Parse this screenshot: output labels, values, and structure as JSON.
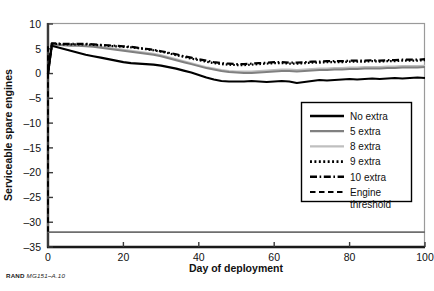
{
  "figure": {
    "source_note_prefix": "RAND",
    "source_note_id": "MG151–A.10",
    "background_color": "#ffffff"
  },
  "chart_data": {
    "type": "line",
    "title": "",
    "xlabel": "Day of deployment",
    "ylabel": "Serviceable spare engines",
    "xlim": [
      0,
      100
    ],
    "ylim": [
      -35,
      10
    ],
    "xticks": [
      0,
      20,
      40,
      60,
      80,
      100
    ],
    "yticks": [
      10,
      5,
      0,
      -5,
      -10,
      -15,
      -20,
      -25,
      -30,
      -35
    ],
    "grid": false,
    "legend_position": "center-right",
    "colors": {
      "no_extra": "#000000",
      "five_extra": "#808080",
      "eight_extra": "#bfbfbf",
      "nine_extra": "#000000",
      "ten_extra": "#000000",
      "engine_threshold": "#000000",
      "axis": "#6e6e6e",
      "frame": "#9a9a9a"
    },
    "series": [
      {
        "name": "No extra",
        "style": "solid",
        "color": "#000000",
        "width": 2.2,
        "x": [
          0,
          1,
          2,
          4,
          6,
          8,
          10,
          12,
          14,
          16,
          18,
          20,
          22,
          24,
          26,
          28,
          30,
          32,
          34,
          36,
          38,
          40,
          42,
          44,
          46,
          48,
          50,
          52,
          54,
          56,
          58,
          60,
          62,
          64,
          66,
          68,
          70,
          72,
          74,
          76,
          78,
          80,
          82,
          84,
          86,
          88,
          90,
          92,
          94,
          96,
          98,
          100
        ],
        "values": [
          0,
          5.6,
          5.4,
          5.0,
          4.6,
          4.2,
          3.8,
          3.5,
          3.2,
          2.9,
          2.6,
          2.3,
          2.1,
          2.0,
          1.9,
          1.8,
          1.6,
          1.3,
          1.0,
          0.6,
          0.2,
          -0.3,
          -0.8,
          -1.2,
          -1.5,
          -1.6,
          -1.6,
          -1.6,
          -1.5,
          -1.6,
          -1.7,
          -1.6,
          -1.5,
          -1.6,
          -1.9,
          -1.7,
          -1.5,
          -1.3,
          -1.4,
          -1.3,
          -1.2,
          -1.1,
          -1.2,
          -1.1,
          -1.0,
          -1.1,
          -1.0,
          -0.9,
          -1.0,
          -0.9,
          -0.8,
          -0.9
        ]
      },
      {
        "name": "5 extra",
        "style": "solid",
        "color": "#808080",
        "width": 2.0,
        "x": [
          0,
          1,
          2,
          4,
          6,
          8,
          10,
          12,
          14,
          16,
          18,
          20,
          22,
          24,
          26,
          28,
          30,
          32,
          34,
          36,
          38,
          40,
          42,
          44,
          46,
          48,
          50,
          52,
          54,
          56,
          58,
          60,
          62,
          64,
          66,
          68,
          70,
          72,
          74,
          76,
          78,
          80,
          82,
          84,
          86,
          88,
          90,
          92,
          94,
          96,
          98,
          100
        ],
        "values": [
          0,
          5.9,
          5.8,
          5.7,
          5.6,
          5.6,
          5.5,
          5.4,
          5.2,
          5.0,
          4.8,
          4.6,
          4.4,
          4.2,
          4.0,
          3.8,
          3.5,
          3.1,
          2.7,
          2.3,
          1.9,
          1.5,
          1.1,
          0.8,
          0.5,
          0.3,
          0.2,
          0.1,
          0.1,
          0.2,
          0.3,
          0.4,
          0.5,
          0.5,
          0.4,
          0.5,
          0.6,
          0.7,
          0.7,
          0.8,
          0.8,
          0.9,
          0.9,
          1.0,
          1.0,
          1.0,
          1.1,
          1.1,
          1.2,
          1.2,
          1.2,
          1.3
        ]
      },
      {
        "name": "8 extra",
        "style": "solid",
        "color": "#bfbfbf",
        "width": 2.0,
        "x": [
          0,
          1,
          2,
          4,
          6,
          8,
          10,
          12,
          14,
          16,
          18,
          20,
          22,
          24,
          26,
          28,
          30,
          32,
          34,
          36,
          38,
          40,
          42,
          44,
          46,
          48,
          50,
          52,
          54,
          56,
          58,
          60,
          62,
          64,
          66,
          68,
          70,
          72,
          74,
          76,
          78,
          80,
          82,
          84,
          86,
          88,
          90,
          92,
          94,
          96,
          98,
          100
        ],
        "values": [
          0,
          6.0,
          5.9,
          5.8,
          5.8,
          5.7,
          5.7,
          5.6,
          5.4,
          5.2,
          5.0,
          4.8,
          4.6,
          4.4,
          4.2,
          4.0,
          3.7,
          3.3,
          2.9,
          2.5,
          2.1,
          1.7,
          1.3,
          1.0,
          0.7,
          0.5,
          0.4,
          0.4,
          0.4,
          0.5,
          0.6,
          0.7,
          0.8,
          0.8,
          0.7,
          0.8,
          0.9,
          1.0,
          1.0,
          1.1,
          1.1,
          1.2,
          1.2,
          1.3,
          1.3,
          1.3,
          1.4,
          1.4,
          1.5,
          1.5,
          1.5,
          1.6
        ]
      },
      {
        "name": "9 extra",
        "style": "dotted",
        "color": "#000000",
        "width": 2.2,
        "x": [
          0,
          1,
          2,
          4,
          6,
          8,
          10,
          12,
          14,
          16,
          18,
          20,
          22,
          24,
          26,
          28,
          30,
          32,
          34,
          36,
          38,
          40,
          42,
          44,
          46,
          48,
          50,
          52,
          54,
          56,
          58,
          60,
          62,
          64,
          66,
          68,
          70,
          72,
          74,
          76,
          78,
          80,
          82,
          84,
          86,
          88,
          90,
          92,
          94,
          96,
          98,
          100
        ],
        "values": [
          0,
          6.0,
          6.0,
          5.9,
          5.9,
          5.9,
          5.9,
          5.8,
          5.7,
          5.6,
          5.5,
          5.4,
          5.3,
          5.1,
          4.9,
          4.7,
          4.4,
          4.1,
          3.7,
          3.4,
          3.0,
          2.7,
          2.4,
          2.1,
          1.9,
          1.8,
          1.7,
          1.7,
          1.8,
          1.9,
          2.0,
          2.1,
          2.1,
          2.0,
          2.0,
          2.1,
          2.2,
          2.2,
          2.3,
          2.3,
          2.3,
          2.4,
          2.4,
          2.4,
          2.5,
          2.4,
          2.5,
          2.5,
          2.6,
          2.6,
          2.6,
          2.7
        ]
      },
      {
        "name": "10 extra",
        "style": "dashdot",
        "color": "#000000",
        "width": 2.2,
        "x": [
          0,
          1,
          2,
          4,
          6,
          8,
          10,
          12,
          14,
          16,
          18,
          20,
          22,
          24,
          26,
          28,
          30,
          32,
          34,
          36,
          38,
          40,
          42,
          44,
          46,
          48,
          50,
          52,
          54,
          56,
          58,
          60,
          62,
          64,
          66,
          68,
          70,
          72,
          74,
          76,
          78,
          80,
          82,
          84,
          86,
          88,
          90,
          92,
          94,
          96,
          98,
          100
        ],
        "values": [
          0,
          6.1,
          6.1,
          6.0,
          6.0,
          6.0,
          6.0,
          5.9,
          5.8,
          5.7,
          5.6,
          5.5,
          5.4,
          5.2,
          5.0,
          4.8,
          4.5,
          4.2,
          3.9,
          3.5,
          3.2,
          2.9,
          2.6,
          2.3,
          2.1,
          2.0,
          1.9,
          1.9,
          2.0,
          2.1,
          2.2,
          2.3,
          2.3,
          2.2,
          2.2,
          2.3,
          2.4,
          2.4,
          2.5,
          2.5,
          2.5,
          2.6,
          2.6,
          2.6,
          2.7,
          2.6,
          2.7,
          2.7,
          2.8,
          2.8,
          2.8,
          2.9
        ]
      },
      {
        "name": "Engine threshold",
        "style": "dashed",
        "color": "#000000",
        "width": 2.0,
        "x": [
          0,
          0
        ],
        "values": [
          5.5,
          -32
        ]
      }
    ],
    "floor_line": {
      "name": "floor",
      "color": "#6e6e6e",
      "x": [
        0,
        100
      ],
      "values": [
        -32,
        -32
      ]
    }
  },
  "legend": {
    "items": [
      {
        "label": "No extra",
        "style": "solid",
        "color": "#000000",
        "width": 2.6
      },
      {
        "label": "5 extra",
        "style": "solid",
        "color": "#808080",
        "width": 2.2
      },
      {
        "label": "8 extra",
        "style": "solid",
        "color": "#bfbfbf",
        "width": 2.2
      },
      {
        "label": "9 extra",
        "style": "dotted",
        "color": "#000000",
        "width": 2.6
      },
      {
        "label": "10 extra",
        "style": "dashdot",
        "color": "#000000",
        "width": 2.6
      },
      {
        "label": "Engine",
        "label2": "threshold",
        "style": "dashed",
        "color": "#000000",
        "width": 2.2
      }
    ]
  }
}
